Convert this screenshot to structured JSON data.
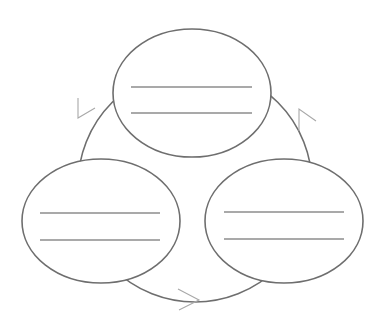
{
  "diagram": {
    "type": "cycle",
    "colors": {
      "stroke": "#6e6e6e",
      "text_line": "#8c8c8c",
      "arrow": "#a8a8a8",
      "background": "#ffffff"
    },
    "cycle_ring": {
      "cx": 195,
      "cy": 185,
      "r": 117
    },
    "nodes": [
      {
        "id": "top",
        "cx": 192,
        "cy": 93,
        "rx": 79,
        "ry": 64,
        "text_lines": [
          {
            "x1": 131,
            "x2": 252,
            "y": 87,
            "text": ""
          },
          {
            "x1": 131,
            "x2": 252,
            "y": 113,
            "text": ""
          }
        ]
      },
      {
        "id": "bottom-left",
        "cx": 101,
        "cy": 221,
        "rx": 79,
        "ry": 62,
        "text_lines": [
          {
            "x1": 40,
            "x2": 160,
            "y": 213,
            "text": ""
          },
          {
            "x1": 40,
            "x2": 160,
            "y": 240,
            "text": ""
          }
        ]
      },
      {
        "id": "bottom-right",
        "cx": 284,
        "cy": 221,
        "rx": 79,
        "ry": 62,
        "text_lines": [
          {
            "x1": 224,
            "x2": 344,
            "y": 212,
            "text": ""
          },
          {
            "x1": 224,
            "x2": 344,
            "y": 239,
            "text": ""
          }
        ]
      }
    ],
    "arrows": [
      {
        "id": "arrow-right",
        "direction": "down-right",
        "tip": [
          299,
          109
        ]
      },
      {
        "id": "arrow-bottom",
        "direction": "right",
        "tip": [
          199,
          300
        ]
      },
      {
        "id": "arrow-left",
        "direction": "up-right",
        "tip": [
          78,
          118
        ]
      }
    ]
  }
}
